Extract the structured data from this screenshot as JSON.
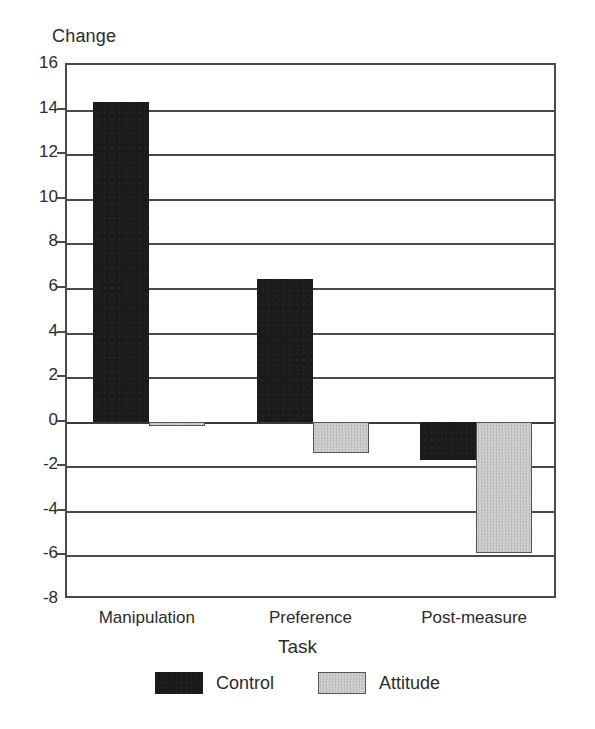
{
  "chart_data": {
    "type": "bar",
    "title": "",
    "xlabel": "Task",
    "ylabel": "Change",
    "categories": [
      "Manipulation",
      "Preference",
      "Post-measure"
    ],
    "series": [
      {
        "name": "Control",
        "values": [
          14.35,
          6.4,
          -1.7
        ],
        "color": "#1a1a1a"
      },
      {
        "name": "Attitude",
        "values": [
          -0.2,
          -1.4,
          -5.9
        ],
        "color": "#c9c9c9"
      }
    ],
    "ylim": [
      -8,
      16
    ],
    "ytick_labels": [
      "16",
      "14",
      "12",
      "10",
      "8",
      "6",
      "4",
      "2",
      "0",
      "-2",
      "-4",
      "-6",
      "-8"
    ],
    "ytick_values": [
      16,
      14,
      12,
      10,
      8,
      6,
      4,
      2,
      0,
      -2,
      -4,
      -6,
      -8
    ],
    "grid": true,
    "legend_position": "bottom",
    "zero_line": 0
  },
  "axes": {
    "y_title": "Change",
    "x_title": "Task"
  },
  "legend": {
    "items": [
      {
        "label": "Control",
        "swatch": "control-swatch"
      },
      {
        "label": "Attitude",
        "swatch": "attitude-swatch"
      }
    ]
  }
}
